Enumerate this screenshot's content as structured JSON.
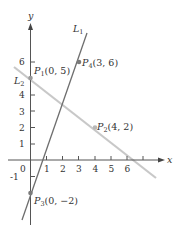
{
  "diagram": {
    "type": "coordinate-plane",
    "axes": {
      "x_label": "x",
      "y_label": "y"
    },
    "x_ticks": [
      "0",
      "1",
      "2",
      "3",
      "4",
      "5",
      "6"
    ],
    "y_ticks": [
      "-1",
      "1",
      "2",
      "3",
      "4",
      "6"
    ],
    "lines": [
      {
        "name": "L",
        "sub": "1",
        "color": "#6e6e6e",
        "through": [
          "P3",
          "P4"
        ]
      },
      {
        "name": "L",
        "sub": "2",
        "color": "#c8c8c8",
        "through": [
          "P1",
          "P2"
        ]
      }
    ],
    "points": [
      {
        "name": "P",
        "sub": "1",
        "coords": "(0, 5)"
      },
      {
        "name": "P",
        "sub": "2",
        "coords": "(4, 2)"
      },
      {
        "name": "P",
        "sub": "3",
        "coords": "(0, −2)"
      },
      {
        "name": "P",
        "sub": "4",
        "coords": "(3, 6)"
      }
    ]
  }
}
